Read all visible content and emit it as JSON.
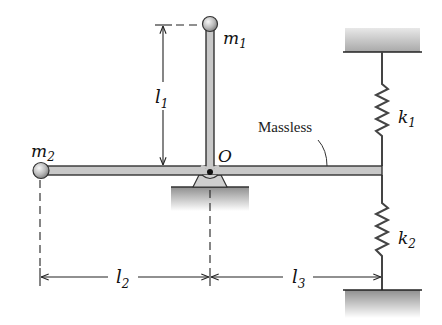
{
  "diagram": {
    "colors": {
      "rod_fill": "#c8c8c8",
      "rod_stroke": "#333333",
      "ball_light": "#f2f2f2",
      "ball_dark": "#8a8a8a",
      "ground_top": "#9a9a9a",
      "ground_bottom": "#ffffff",
      "line": "#222222"
    },
    "labels": {
      "m1": {
        "base": "m",
        "sub": "1"
      },
      "m2": {
        "base": "m",
        "sub": "2"
      },
      "k1": {
        "base": "k",
        "sub": "1"
      },
      "k2": {
        "base": "k",
        "sub": "2"
      },
      "l1": {
        "base": "l",
        "sub": "1"
      },
      "l2": {
        "base": "l",
        "sub": "2"
      },
      "l3": {
        "base": "l",
        "sub": "3"
      },
      "pivot": "O",
      "massless_note": "Massless"
    },
    "components": [
      {
        "id": "mass-1",
        "label": "m1",
        "position": "top of vertical arm"
      },
      {
        "id": "mass-2",
        "label": "m2",
        "position": "left end of horizontal arm"
      },
      {
        "id": "pivot",
        "label": "O",
        "position": "junction of arms, pinned support"
      },
      {
        "id": "spring-1",
        "label": "k1",
        "connects": "right end of rod to upper wall"
      },
      {
        "id": "spring-2",
        "label": "k2",
        "connects": "right end of rod to lower wall"
      }
    ],
    "dimensions": [
      {
        "label": "l1",
        "from": "pivot",
        "to": "m1",
        "orientation": "vertical"
      },
      {
        "label": "l2",
        "from": "m2",
        "to": "pivot",
        "orientation": "horizontal"
      },
      {
        "label": "l3",
        "from": "pivot",
        "to": "spring attachment",
        "orientation": "horizontal"
      }
    ]
  }
}
